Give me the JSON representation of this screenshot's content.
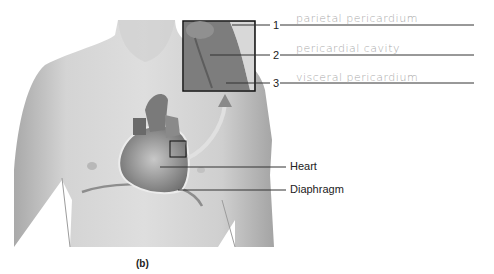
{
  "figure": {
    "caption": "(b)",
    "labels": {
      "heart": "Heart",
      "diaphragm": "Diaphragm"
    },
    "inset_labels": [
      {
        "number": "1",
        "answer": "parietal pericardium"
      },
      {
        "number": "2",
        "answer": "pericardial cavity"
      },
      {
        "number": "3",
        "answer": "visceral pericardium"
      }
    ]
  },
  "colors": {
    "skin_light": "#d9d9d9",
    "skin_mid": "#bdbdbd",
    "skin_dark": "#8a8a8a",
    "line": "#333333",
    "handwriting": "#aaaaaa"
  }
}
